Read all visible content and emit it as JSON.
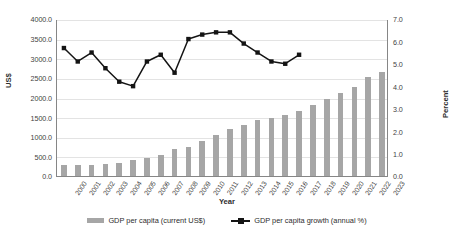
{
  "chart_data": {
    "type": "bar",
    "title": "",
    "xlabel": "Year",
    "ylabel": "US$",
    "ylabel_secondary": "Percent",
    "grid": true,
    "legend_position": "bottom",
    "categories": [
      "2000",
      "2001",
      "2002",
      "2003",
      "2004",
      "2005",
      "2006",
      "2007",
      "2008",
      "2009",
      "2010",
      "2011",
      "2012",
      "2013",
      "2014",
      "2015",
      "2016",
      "2017",
      "2018",
      "2019",
      "2020",
      "2021",
      "2022",
      "2023"
    ],
    "ylim": [
      0,
      4000
    ],
    "yticks": [
      "0.0",
      "500.0",
      "1000.0",
      "1500.0",
      "2000.0",
      "2500.0",
      "3000.0",
      "3500.0",
      "4000.0"
    ],
    "ylim_secondary": [
      0,
      7
    ],
    "yticks_secondary": [
      "0.0",
      "1.0",
      "2.0",
      "3.0",
      "4.0",
      "5.0",
      "6.0",
      "7.0"
    ],
    "series": [
      {
        "name": "GDP per capita (current US$)",
        "type": "bar",
        "axis": "left",
        "color": "#a6a6a6",
        "values": [
          270,
          275,
          285,
          305,
          330,
          400,
          450,
          540,
          690,
          740,
          880,
          1040,
          1190,
          1300,
          1430,
          1470,
          1560,
          1660,
          1800,
          1960,
          2110,
          2280,
          2520,
          2640
        ]
      },
      {
        "name": "GDP per capita growth (annual %)",
        "type": "line",
        "axis": "right",
        "color": "#141414",
        "marker": "square",
        "values": [
          5.75,
          5.15,
          5.55,
          4.85,
          4.25,
          4.05,
          5.15,
          5.45,
          4.65,
          6.15,
          6.35,
          6.45,
          6.45,
          5.95,
          5.55,
          5.15,
          5.05,
          5.45,
          null,
          null,
          null,
          null,
          null,
          null
        ]
      }
    ]
  },
  "legend": [
    {
      "label": "GDP per capita (current US$)",
      "marker": "bar-swatch"
    },
    {
      "label": "GDP per capita growth (annual %)",
      "marker": "line-marker-swatch"
    }
  ]
}
